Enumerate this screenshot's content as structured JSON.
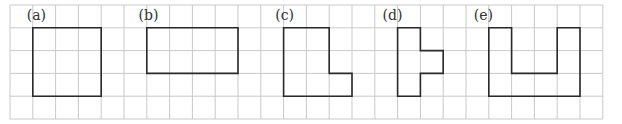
{
  "grid": {
    "cols": 26,
    "rows": 5,
    "origin_x": 10,
    "origin_y": 5,
    "cell": 22.8,
    "line_color": "#c9c9c9"
  },
  "shape_color": "#2a2a2a",
  "figures": [
    {
      "label": "(a)",
      "label_col": 1,
      "points": [
        [
          1,
          1
        ],
        [
          4,
          1
        ],
        [
          4,
          4
        ],
        [
          1,
          4
        ]
      ]
    },
    {
      "label": "(b)",
      "label_col": 5.9,
      "points": [
        [
          6,
          1
        ],
        [
          10,
          1
        ],
        [
          10,
          3
        ],
        [
          6,
          3
        ]
      ]
    },
    {
      "label": "(c)",
      "label_col": 11.9,
      "points": [
        [
          12,
          1
        ],
        [
          14,
          1
        ],
        [
          14,
          3
        ],
        [
          15,
          3
        ],
        [
          15,
          4
        ],
        [
          12,
          4
        ]
      ]
    },
    {
      "label": "(d)",
      "label_col": 16.6,
      "points": [
        [
          17,
          1
        ],
        [
          18,
          1
        ],
        [
          18,
          2
        ],
        [
          19,
          2
        ],
        [
          19,
          3
        ],
        [
          18,
          3
        ],
        [
          18,
          4
        ],
        [
          17,
          4
        ]
      ]
    },
    {
      "label": "(e)",
      "label_col": 20.6,
      "points": [
        [
          21,
          1
        ],
        [
          22,
          1
        ],
        [
          22,
          3
        ],
        [
          24,
          3
        ],
        [
          24,
          1
        ],
        [
          25,
          1
        ],
        [
          25,
          4
        ],
        [
          21,
          4
        ]
      ]
    }
  ]
}
